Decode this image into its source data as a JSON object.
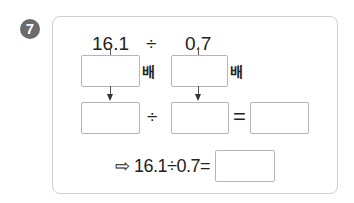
{
  "problem": {
    "number": "7",
    "dividend": "16.1",
    "divisor": "0.7",
    "div_sign": "÷",
    "times_label": "배",
    "equals_sign": "=",
    "answer_line": "⇨ 16.1÷0.7="
  },
  "answer_boxes": {
    "multiplier_dividend": "",
    "multiplier_divisor": "",
    "new_dividend": "",
    "new_divisor": "",
    "quotient": "",
    "final_answer": ""
  },
  "colors": {
    "badge": "#6b6b6b",
    "border": "#cfcfcf",
    "box_border": "#b5b5b5"
  }
}
